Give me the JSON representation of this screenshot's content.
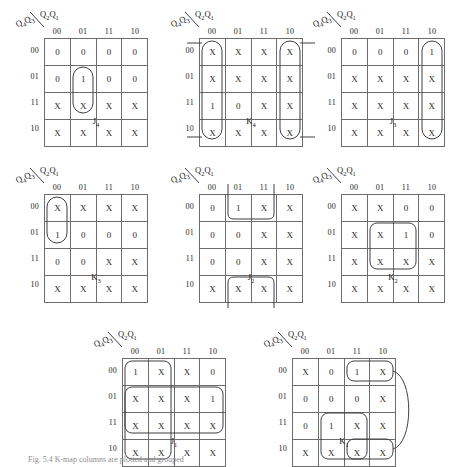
{
  "figure": {
    "caption": "Fig. 5.4  K-map columns are plotted and grouped",
    "row_header_label": "Q4Q3",
    "col_header_label": "Q2Q1",
    "col_labels": [
      "00",
      "01",
      "11",
      "10"
    ],
    "row_labels": [
      "00",
      "01",
      "11",
      "10"
    ]
  },
  "maps": [
    {
      "name": "J4",
      "label": "J4",
      "position": {
        "left": 14,
        "top": 8
      },
      "cells": [
        [
          "0",
          "0",
          "0",
          "0"
        ],
        [
          "0",
          "1",
          "0",
          "0"
        ],
        [
          "X",
          "X",
          "X",
          "X"
        ],
        [
          "X",
          "X",
          "X",
          "X"
        ]
      ],
      "groups": [
        {
          "shape": "oval",
          "col": 1,
          "row": 1,
          "cols": 1,
          "rows": 2
        }
      ]
    },
    {
      "name": "K4",
      "label": "K4",
      "position": {
        "left": 169,
        "top": 8
      },
      "cells": [
        [
          "X",
          "X",
          "X",
          "X"
        ],
        [
          "X",
          "X",
          "X",
          "X"
        ],
        [
          "1",
          "0",
          "X",
          "X"
        ],
        [
          "X",
          "X",
          "X",
          "X"
        ]
      ],
      "groups": [
        {
          "shape": "oval",
          "col": 0,
          "row": 0,
          "cols": 1,
          "rows": 4,
          "wrap": "horizontal"
        },
        {
          "shape": "oval",
          "col": 3,
          "row": 0,
          "cols": 1,
          "rows": 4,
          "wrap": "horizontal"
        }
      ]
    },
    {
      "name": "J3",
      "label": "J3",
      "position": {
        "left": 311,
        "top": 8
      },
      "cells": [
        [
          "0",
          "0",
          "0",
          "1"
        ],
        [
          "X",
          "X",
          "X",
          "X"
        ],
        [
          "X",
          "X",
          "X",
          "X"
        ],
        [
          "X",
          "X",
          "X",
          "X"
        ]
      ],
      "groups": [
        {
          "shape": "oval",
          "col": 3,
          "row": 0,
          "cols": 1,
          "rows": 4
        }
      ]
    },
    {
      "name": "K3",
      "label": "K3",
      "position": {
        "left": 14,
        "top": 164
      },
      "cells": [
        [
          "X",
          "X",
          "X",
          "X"
        ],
        [
          "1",
          "0",
          "0",
          "0"
        ],
        [
          "0",
          "0",
          "X",
          "X"
        ],
        [
          "X",
          "X",
          "X",
          "X"
        ]
      ],
      "groups": [
        {
          "shape": "oval",
          "col": 0,
          "row": 0,
          "cols": 1,
          "rows": 2
        }
      ]
    },
    {
      "name": "J2",
      "label": "J2",
      "position": {
        "left": 169,
        "top": 164
      },
      "cells": [
        [
          "0",
          "1",
          "X",
          "X"
        ],
        [
          "0",
          "0",
          "X",
          "X"
        ],
        [
          "0",
          "0",
          "X",
          "X"
        ],
        [
          "X",
          "X",
          "X",
          "X"
        ]
      ],
      "groups": [
        {
          "shape": "wrap-vertical",
          "col": 1,
          "cols": 2
        }
      ]
    },
    {
      "name": "K2",
      "label": "K2",
      "position": {
        "left": 311,
        "top": 164
      },
      "cells": [
        [
          "X",
          "X",
          "0",
          "0"
        ],
        [
          "X",
          "X",
          "1",
          "0"
        ],
        [
          "X",
          "X",
          "X",
          "X"
        ],
        [
          "X",
          "X",
          "X",
          "X"
        ]
      ],
      "groups": [
        {
          "shape": "rounded",
          "col": 1,
          "row": 1,
          "cols": 2,
          "rows": 2
        }
      ]
    },
    {
      "name": "J1",
      "label": "J1",
      "position": {
        "left": 92,
        "top": 328
      },
      "cells": [
        [
          "1",
          "X",
          "X",
          "0"
        ],
        [
          "X",
          "X",
          "X",
          "1"
        ],
        [
          "X",
          "X",
          "X",
          "X"
        ],
        [
          "X",
          "X",
          "X",
          "X"
        ]
      ],
      "groups": [
        {
          "shape": "rounded",
          "col": 0,
          "row": 0,
          "cols": 2,
          "rows": 4
        },
        {
          "shape": "rounded",
          "col": 0,
          "row": 1,
          "cols": 4,
          "rows": 2
        }
      ]
    },
    {
      "name": "K1",
      "label": "K1",
      "position": {
        "left": 262,
        "top": 328
      },
      "cells": [
        [
          "X",
          "0",
          "1",
          "X"
        ],
        [
          "0",
          "0",
          "0",
          "X"
        ],
        [
          "0",
          "1",
          "X",
          "X"
        ],
        [
          "X",
          "X",
          "X",
          "X"
        ]
      ],
      "groups": [
        {
          "shape": "rounded",
          "col": 2,
          "row": 0,
          "cols": 2,
          "rows": 1
        },
        {
          "shape": "rounded",
          "col": 1,
          "row": 2,
          "cols": 2,
          "rows": 2
        },
        {
          "shape": "rounded",
          "col": 2,
          "row": 3,
          "cols": 2,
          "rows": 1
        },
        {
          "shape": "arc-right",
          "from_row": 0,
          "to_row": 3
        }
      ]
    }
  ]
}
